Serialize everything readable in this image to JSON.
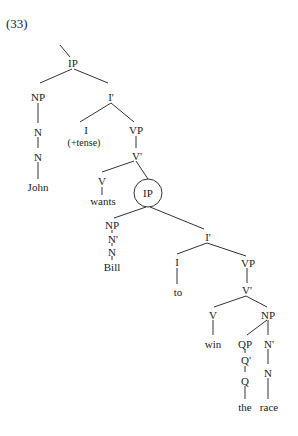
{
  "example_number": "(33)",
  "nodes": {
    "ip_top": "IP",
    "np_subj": "NP",
    "n_subj1": "N",
    "n_subj2": "N",
    "john": "John",
    "i_bar_top": "I'",
    "i_top": "I",
    "tense": "(+tense)",
    "vp_top": "VP",
    "v_bar_top": "V'",
    "v_top": "V",
    "wants": "wants",
    "ip_circled": "IP",
    "np_bill": "NP",
    "n_bar_bill": "N'",
    "n_bill": "N",
    "bill": "Bill",
    "i_bar_low": "I'",
    "i_low": "I",
    "to": "to",
    "vp_low": "VP",
    "v_bar_low": "V'",
    "v_low": "V",
    "win": "win",
    "np_obj": "NP",
    "qp": "QP",
    "q_bar": "Q'",
    "q": "Q",
    "the": "the",
    "n_bar_obj": "N'",
    "n_obj": "N",
    "race": "race"
  }
}
